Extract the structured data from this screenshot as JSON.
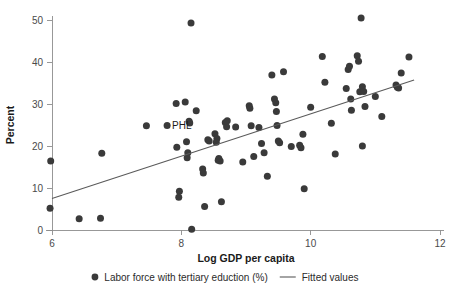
{
  "chart_data": {
    "type": "scatter",
    "title": "",
    "xlabel": "Log GDP per capita",
    "ylabel": "Percent",
    "xlim": [
      6,
      12
    ],
    "ylim": [
      0,
      50
    ],
    "xticks": [
      6,
      8,
      10,
      12
    ],
    "xtick_labels": [
      "6",
      "8",
      "10",
      "12"
    ],
    "yticks": [
      0,
      10,
      20,
      30,
      40,
      50
    ],
    "ytick_labels": [
      "0",
      "10",
      "20",
      "30",
      "40",
      "50"
    ],
    "grid": false,
    "legend_position": "bottom-center",
    "legend": [
      {
        "marker": "circle",
        "label": "Labor force with tertiary eduction (%)"
      },
      {
        "marker": "line",
        "label": "Fitted values"
      }
    ],
    "annotations": [
      {
        "text": "PHL",
        "x": 7.78,
        "y": 24.9
      }
    ],
    "series": [
      {
        "name": "Labor force with tertiary eduction (%)",
        "marker": "circle",
        "color": "#3a3a3a",
        "points": [
          [
            5.98,
            16.4
          ],
          [
            5.97,
            5.2
          ],
          [
            6.42,
            2.7
          ],
          [
            6.75,
            2.8
          ],
          [
            6.77,
            18.3
          ],
          [
            7.46,
            24.8
          ],
          [
            7.78,
            24.9
          ],
          [
            7.92,
            30.1
          ],
          [
            7.93,
            19.7
          ],
          [
            7.97,
            9.2
          ],
          [
            7.96,
            7.8
          ],
          [
            8.06,
            30.5
          ],
          [
            8.08,
            21.0
          ],
          [
            8.1,
            18.4
          ],
          [
            8.09,
            17.2
          ],
          [
            8.12,
            25.9
          ],
          [
            8.13,
            25.5
          ],
          [
            8.15,
            49.3
          ],
          [
            8.16,
            0.2
          ],
          [
            8.23,
            28.4
          ],
          [
            8.33,
            14.5
          ],
          [
            8.34,
            13.6
          ],
          [
            8.36,
            5.6
          ],
          [
            8.41,
            21.5
          ],
          [
            8.43,
            21.2
          ],
          [
            8.52,
            22.9
          ],
          [
            8.55,
            21.8
          ],
          [
            8.54,
            20.9
          ],
          [
            8.57,
            16.6
          ],
          [
            8.6,
            16.4
          ],
          [
            8.58,
            17.0
          ],
          [
            8.62,
            6.7
          ],
          [
            8.68,
            25.6
          ],
          [
            8.7,
            24.6
          ],
          [
            8.71,
            26.0
          ],
          [
            8.84,
            24.5
          ],
          [
            8.95,
            16.2
          ],
          [
            9.05,
            29.6
          ],
          [
            9.06,
            29.0
          ],
          [
            9.08,
            24.8
          ],
          [
            9.12,
            17.5
          ],
          [
            9.2,
            24.4
          ],
          [
            9.24,
            20.6
          ],
          [
            9.28,
            18.4
          ],
          [
            9.33,
            12.8
          ],
          [
            9.44,
            31.2
          ],
          [
            9.46,
            30.3
          ],
          [
            9.47,
            28.2
          ],
          [
            9.48,
            24.9
          ],
          [
            9.5,
            21.2
          ],
          [
            9.52,
            20.8
          ],
          [
            9.4,
            36.9
          ],
          [
            9.58,
            37.7
          ],
          [
            9.7,
            19.9
          ],
          [
            9.83,
            20.2
          ],
          [
            9.85,
            19.6
          ],
          [
            9.88,
            22.8
          ],
          [
            9.9,
            9.8
          ],
          [
            10.0,
            29.2
          ],
          [
            10.18,
            41.3
          ],
          [
            10.22,
            35.2
          ],
          [
            10.32,
            25.4
          ],
          [
            10.38,
            18.1
          ],
          [
            10.55,
            33.7
          ],
          [
            10.58,
            38.2
          ],
          [
            10.6,
            39.0
          ],
          [
            10.62,
            31.2
          ],
          [
            10.63,
            28.5
          ],
          [
            10.72,
            41.5
          ],
          [
            10.74,
            40.2
          ],
          [
            10.78,
            50.5
          ],
          [
            10.76,
            32.9
          ],
          [
            10.8,
            34.1
          ],
          [
            10.82,
            33.0
          ],
          [
            10.84,
            29.4
          ],
          [
            10.8,
            20.0
          ],
          [
            11.0,
            31.8
          ],
          [
            11.1,
            27.0
          ],
          [
            11.32,
            34.5
          ],
          [
            11.34,
            34.0
          ],
          [
            11.36,
            33.8
          ],
          [
            11.4,
            37.4
          ],
          [
            11.52,
            41.2
          ]
        ]
      },
      {
        "name": "Fitted values",
        "type": "line",
        "color": "#5a5a5a",
        "endpoints": [
          [
            6.0,
            7.5
          ],
          [
            11.6,
            35.7
          ]
        ]
      }
    ]
  }
}
